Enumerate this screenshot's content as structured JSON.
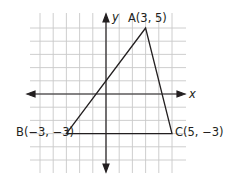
{
  "diagram": {
    "type": "coordinate-plane-triangle",
    "grid": {
      "x_min": -5,
      "x_max": 6,
      "y_min": -6,
      "y_max": 6,
      "origin_px": [
        106,
        94
      ],
      "unit_px": 13.2,
      "grid_color": "#c8c8c8",
      "axis_color": "#231f20"
    },
    "axes": {
      "x_label": "x",
      "y_label": "y"
    },
    "triangle": {
      "stroke_color": "#231f20",
      "vertices": [
        {
          "name": "A",
          "x": 3,
          "y": 5,
          "label": "A(3, 5)"
        },
        {
          "name": "B",
          "x": -3,
          "y": -3,
          "label": "B(−3, −3)"
        },
        {
          "name": "C",
          "x": 5,
          "y": -3,
          "label": "C(5, −3)"
        }
      ]
    }
  }
}
